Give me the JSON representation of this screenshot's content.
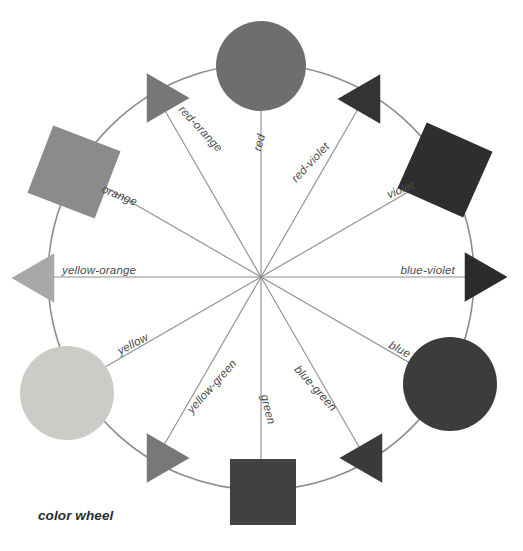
{
  "figure": {
    "caption": "color wheel",
    "background_color": "#ffffff",
    "ring_color": "#8d8d8d",
    "spoke_color": "#8d8d8d",
    "label_color": "#4a4a4a",
    "center_x": 261,
    "center_y": 277,
    "ring_radius": 213
  },
  "chart_data": {
    "type": "pie",
    "title": "color wheel",
    "xlabel": "",
    "ylabel": "",
    "grid": false,
    "legend": "none",
    "categories": [
      "red",
      "red-violet",
      "violet",
      "blue-violet",
      "blue",
      "blue-green",
      "green",
      "yellow-green",
      "yellow",
      "yellow-orange",
      "orange",
      "red-orange"
    ],
    "values": [
      30,
      30,
      30,
      30,
      30,
      30,
      30,
      30,
      30,
      30,
      30,
      30
    ],
    "annotations": [
      "red",
      "red-orange",
      "orange",
      "yellow-orange",
      "yellow",
      "yellow-green",
      "green",
      "blue-green",
      "blue",
      "blue-violet",
      "violet",
      "red-violet"
    ]
  },
  "wheel": {
    "segments": [
      {
        "name": "red",
        "label": "red",
        "shape": "circle",
        "tier": "primary",
        "angle_deg": 90,
        "fill": "#6e6e6e",
        "cx": 261,
        "cy": 66,
        "r": 45,
        "label_x": 265,
        "label_y": 135,
        "label_rotate": -76,
        "label_anchor": "end"
      },
      {
        "name": "red-violet",
        "label": "red-violet",
        "shape": "triangle",
        "tier": "tertiary",
        "angle_deg": 60,
        "fill": "#333333",
        "cx": 366,
        "cy": 99,
        "size": 46,
        "rotate": 240,
        "label_x": 330,
        "label_y": 147,
        "label_rotate": -47,
        "label_anchor": "end"
      },
      {
        "name": "violet",
        "label": "violet",
        "shape": "square",
        "tier": "secondary",
        "angle_deg": 30,
        "fill": "#2e2e2e",
        "cx": 445,
        "cy": 170,
        "size": 72,
        "rotate": 24,
        "label_x": 415,
        "label_y": 188,
        "label_rotate": -22,
        "label_anchor": "end"
      },
      {
        "name": "blue-violet",
        "label": "blue-violet",
        "shape": "triangle",
        "tier": "tertiary",
        "angle_deg": 0,
        "fill": "#2b2b2b",
        "cx": 479,
        "cy": 277,
        "size": 46,
        "rotate": 180,
        "label_x": 455,
        "label_y": 274,
        "label_rotate": 0,
        "label_anchor": "end"
      },
      {
        "name": "blue",
        "label": "blue",
        "shape": "circle",
        "tier": "primary",
        "angle_deg": -30,
        "fill": "#3c3c3c",
        "cx": 450,
        "cy": 384,
        "r": 47,
        "label_x": 408,
        "label_y": 358,
        "label_rotate": 28,
        "label_anchor": "end"
      },
      {
        "name": "blue-green",
        "label": "blue-green",
        "shape": "triangle",
        "tier": "tertiary",
        "angle_deg": -60,
        "fill": "#3a3a3a",
        "cx": 368,
        "cy": 458,
        "size": 46,
        "rotate": 120,
        "label_x": 332,
        "label_y": 412,
        "label_rotate": 48,
        "label_anchor": "end"
      },
      {
        "name": "green",
        "label": "green",
        "shape": "square",
        "tier": "secondary",
        "angle_deg": -90,
        "fill": "#414141",
        "cx": 263,
        "cy": 492,
        "size": 66,
        "rotate": 0,
        "label_x": 268,
        "label_y": 425,
        "label_rotate": 76,
        "label_anchor": "end"
      },
      {
        "name": "yellow-green",
        "label": "yellow-green",
        "shape": "triangle",
        "tier": "tertiary",
        "angle_deg": -120,
        "fill": "#787878",
        "cx": 161,
        "cy": 458,
        "size": 46,
        "rotate": 60,
        "label_x": 192,
        "label_y": 414,
        "label_rotate": -48,
        "label_anchor": "start"
      },
      {
        "name": "yellow",
        "label": "yellow",
        "shape": "circle",
        "tier": "primary",
        "angle_deg": -150,
        "fill": "#cccbc8",
        "cx": 67,
        "cy": 393,
        "r": 47,
        "label_x": 120,
        "label_y": 355,
        "label_rotate": -28,
        "label_anchor": "start"
      },
      {
        "name": "yellow-orange",
        "label": "yellow-orange",
        "shape": "triangle",
        "tier": "tertiary",
        "angle_deg": 180,
        "fill": "#a8a8a8",
        "cx": 40,
        "cy": 278,
        "size": 46,
        "rotate": 0,
        "label_x": 62,
        "label_y": 274,
        "label_rotate": 0,
        "label_anchor": "start"
      },
      {
        "name": "orange",
        "label": "orange",
        "shape": "square",
        "tier": "secondary",
        "angle_deg": 150,
        "fill": "#8b8b8b",
        "cx": 74,
        "cy": 172,
        "size": 72,
        "rotate": 21,
        "label_x": 101,
        "label_y": 192,
        "label_rotate": 22,
        "label_anchor": "start"
      },
      {
        "name": "red-orange",
        "label": "red-orange",
        "shape": "triangle",
        "tier": "tertiary",
        "angle_deg": 120,
        "fill": "#777777",
        "cx": 161,
        "cy": 98,
        "size": 46,
        "rotate": 300,
        "label_x": 178,
        "label_y": 110,
        "label_rotate": 47,
        "label_anchor": "start"
      }
    ]
  }
}
